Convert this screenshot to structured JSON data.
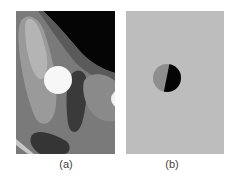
{
  "figure": {
    "panels": [
      {
        "id": "a",
        "caption": "(a)",
        "description": "grayscale phantom with black region upper right, light gray ellipse, white circle, dark gray blobs",
        "colors": {
          "background": "#7a7a7a",
          "black_region": "#050505",
          "light_ellipse": "#a9a9a9",
          "white_circle": "#f7f7f7",
          "dark_blob": "#3a3a3a",
          "right_blob": "#8a8a8a"
        }
      },
      {
        "id": "b",
        "caption": "(b)",
        "description": "uniform light gray field with small circle split into gray and black halves",
        "colors": {
          "background": "#bdbdbd",
          "circle_left": "#8e8e8e",
          "circle_right": "#050505"
        }
      }
    ]
  }
}
